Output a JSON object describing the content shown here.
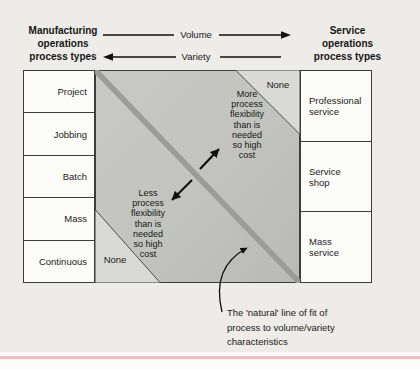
{
  "figure": {
    "left_header": "Manufacturing\noperations\nprocess types",
    "right_header": "Service\noperations\nprocess types",
    "volume_label": "Volume",
    "variety_label": "Variety"
  },
  "manufacturing_types": [
    "Project",
    "Jobbing",
    "Batch",
    "Mass",
    "Continuous"
  ],
  "service_types": [
    "Professional\nservice",
    "Service\nshop",
    "Mass\nservice"
  ],
  "matrix": {
    "none_top_right": "None",
    "none_bottom_left": "None",
    "more_note": "More\nprocess\nflexibility\nthan is\nneeded\nso high\ncost",
    "less_note": "Less\nprocess\nflexibility\nthan is\nneeded\nso high\ncost"
  },
  "annotation": "The 'natural' line of fit of\nprocess to volume/variety\ncharacteristics",
  "colors": {
    "page_background": "#edece8",
    "matrix_fill_light": "#cbccc7",
    "matrix_fill_dark": "#b9bab6",
    "diagonal_band": "#9b9c97",
    "corner_triangle": "#d9d9d5",
    "cell_background": "#fbfbf8",
    "line_color": "#3c3c3c",
    "pink_rule": "#f4bcbc"
  }
}
